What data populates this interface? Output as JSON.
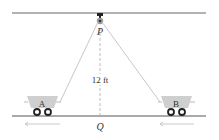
{
  "diagram": {
    "labels": {
      "pulley": "P",
      "ground_point": "Q",
      "height": "12 ft",
      "cart_left": "A",
      "cart_right": "B"
    },
    "colors": {
      "lines": "#555555",
      "rope": "#bbbbbb",
      "cart_body": "#cccccc",
      "wheel": "#222222",
      "arrow": "#bbbbbb"
    }
  }
}
